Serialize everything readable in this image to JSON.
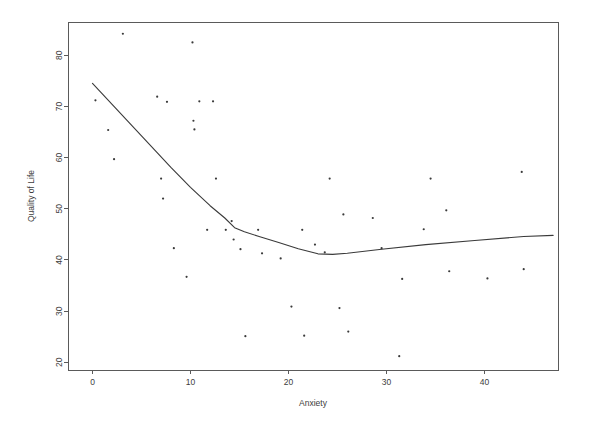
{
  "chart_data": {
    "type": "scatter",
    "title": "",
    "subtitle": "",
    "xlabel": "Anxiety",
    "ylabel": "Quality of Life",
    "xlim": [
      -2.5,
      47.5
    ],
    "ylim": [
      18.5,
      86.5
    ],
    "xticks": [
      0,
      10,
      20,
      30,
      40
    ],
    "xtick_labels": [
      "0",
      "10",
      "20",
      "30",
      "40"
    ],
    "yticks": [
      20,
      30,
      40,
      50,
      60,
      70,
      80
    ],
    "ytick_labels": [
      "20",
      "30",
      "40",
      "50",
      "60",
      "70",
      "80"
    ],
    "grid": false,
    "legend": null,
    "point_color": "#3a3a3a",
    "line_color": "#3a3a3a",
    "axis_color": "#5a5a5a",
    "background": "#ffffff",
    "series": [
      {
        "name": "observations",
        "type": "scatter",
        "points": [
          [
            0.3,
            71.2
          ],
          [
            1.6,
            65.4
          ],
          [
            2.2,
            59.7
          ],
          [
            3.1,
            84.2
          ],
          [
            6.6,
            71.9
          ],
          [
            7.0,
            55.9
          ],
          [
            7.2,
            52.0
          ],
          [
            7.6,
            70.9
          ],
          [
            8.3,
            42.3
          ],
          [
            9.6,
            36.7
          ],
          [
            10.2,
            82.5
          ],
          [
            10.3,
            67.2
          ],
          [
            10.4,
            65.5
          ],
          [
            10.9,
            71.0
          ],
          [
            11.7,
            45.9
          ],
          [
            12.3,
            71.0
          ],
          [
            12.6,
            55.9
          ],
          [
            13.6,
            45.9
          ],
          [
            14.2,
            47.6
          ],
          [
            14.4,
            44.0
          ],
          [
            15.1,
            42.1
          ],
          [
            15.6,
            25.1
          ],
          [
            16.9,
            45.9
          ],
          [
            17.3,
            41.3
          ],
          [
            19.2,
            40.3
          ],
          [
            20.3,
            30.9
          ],
          [
            21.4,
            45.9
          ],
          [
            21.6,
            25.2
          ],
          [
            22.7,
            43.0
          ],
          [
            23.7,
            41.5
          ],
          [
            24.2,
            55.9
          ],
          [
            25.2,
            30.6
          ],
          [
            25.6,
            48.9
          ],
          [
            26.1,
            26.0
          ],
          [
            28.6,
            48.2
          ],
          [
            29.5,
            42.3
          ],
          [
            31.3,
            21.2
          ],
          [
            31.6,
            36.3
          ],
          [
            33.8,
            46.0
          ],
          [
            34.5,
            55.9
          ],
          [
            36.1,
            49.7
          ],
          [
            36.4,
            37.8
          ],
          [
            40.3,
            36.4
          ],
          [
            43.8,
            57.2
          ],
          [
            44.0,
            38.2
          ]
        ]
      },
      {
        "name": "lowess-smooth",
        "type": "line",
        "points": [
          [
            0.0,
            74.5
          ],
          [
            2.0,
            70.4
          ],
          [
            4.0,
            66.3
          ],
          [
            6.0,
            62.2
          ],
          [
            8.0,
            58.1
          ],
          [
            10.0,
            54.2
          ],
          [
            12.0,
            50.6
          ],
          [
            13.5,
            48.2
          ],
          [
            14.5,
            46.3
          ],
          [
            15.5,
            45.5
          ],
          [
            17.0,
            44.6
          ],
          [
            19.0,
            43.4
          ],
          [
            21.0,
            42.2
          ],
          [
            23.0,
            41.2
          ],
          [
            24.5,
            41.1
          ],
          [
            26.0,
            41.3
          ],
          [
            29.5,
            42.1
          ],
          [
            34.0,
            43.0
          ],
          [
            39.0,
            43.8
          ],
          [
            44.0,
            44.6
          ],
          [
            47.0,
            44.8
          ]
        ]
      }
    ]
  },
  "layout": {
    "plot_left": 68,
    "plot_right": 558,
    "plot_top": 22,
    "plot_bottom": 370,
    "point_radius": 1.1,
    "tick_length": 4
  }
}
